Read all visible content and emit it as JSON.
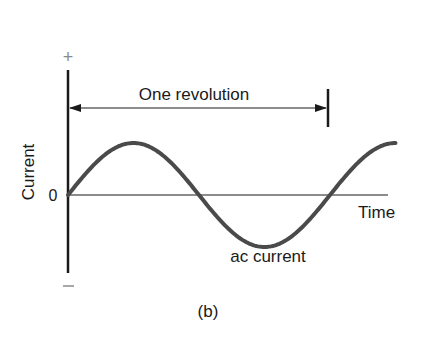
{
  "figure": {
    "panel_label": "(b)",
    "axis": {
      "y_label": "Current",
      "positive_sign": "+",
      "negative_sign": "−",
      "zero_label": "0",
      "x_label": "Time"
    },
    "period_annotation": "One revolution",
    "curve_label": "ac current",
    "colors": {
      "curve": "#4a4a4a",
      "axis": "#1a1a1a",
      "sign": "#8a8a8a"
    }
  },
  "chart_data": {
    "type": "line",
    "title": "",
    "xlabel": "Time",
    "ylabel": "Current",
    "series": [
      {
        "name": "ac current",
        "function": "sine",
        "amplitude": 1,
        "periods_shown": 1.25,
        "start_phase_deg": 0
      }
    ],
    "annotations": [
      "One revolution",
      "ac current",
      "+",
      "0",
      "−"
    ],
    "grid": false
  }
}
